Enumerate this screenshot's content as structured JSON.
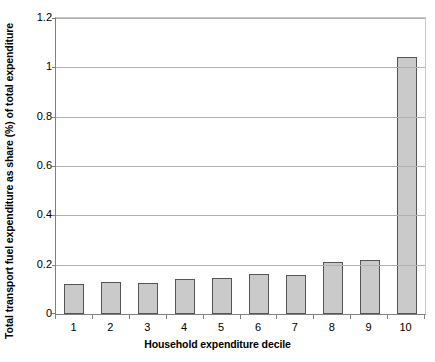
{
  "chart_data": {
    "type": "bar",
    "title": "",
    "xlabel": "Household expenditure decile",
    "ylabel": "Total transport fuel expenditure as share (%) of total expenditure",
    "categories": [
      "1",
      "2",
      "3",
      "4",
      "5",
      "6",
      "7",
      "8",
      "9",
      "10"
    ],
    "values": [
      0.12,
      0.13,
      0.125,
      0.14,
      0.147,
      0.163,
      0.16,
      0.21,
      0.22,
      1.04
    ],
    "series": [
      {
        "name": "Total transport fuel expenditure share",
        "values": [
          0.12,
          0.13,
          0.125,
          0.14,
          0.147,
          0.163,
          0.16,
          0.21,
          0.22,
          1.04
        ]
      }
    ],
    "ylim": [
      0,
      1.2
    ],
    "yticks": [
      0,
      0.2,
      0.4,
      0.6,
      0.8,
      1,
      1.2
    ],
    "yticklabels": [
      "0",
      "0.2",
      "0.4",
      "0.6",
      "0.8",
      "1",
      "1.2"
    ],
    "grid": true,
    "grid_axis": "y",
    "legend": false,
    "legend_position": "none",
    "bar_fill_color": "#cacaca",
    "bar_edge_color": "#555555",
    "gridline_color": "#b0b0b0",
    "axis_color": "#808080",
    "background_color": "#ffffff"
  }
}
